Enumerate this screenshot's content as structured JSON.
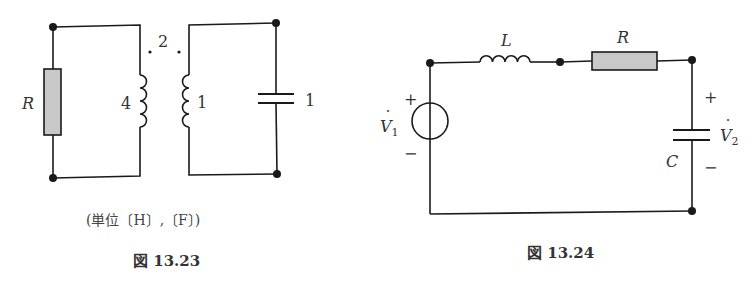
{
  "figures": [
    {
      "id": "fig-13-23",
      "caption": "図 13.23",
      "units_note": "(単位〔H〕,〔F〕)",
      "description": "Coupled-inductor circuit: resistor R on primary side with self-inductance 4, mutual inductance 2 (dot convention), secondary self-inductance 1 with capacitor 1",
      "labels": {
        "resistor": "R",
        "primary_inductance": "4",
        "mutual_inductance": "2",
        "secondary_inductance": "1",
        "capacitance": "1"
      },
      "units": [
        "H",
        "F"
      ]
    },
    {
      "id": "fig-13-24",
      "caption": "図 13.24",
      "description": "Series RLC circuit driven by voltage source V1; output V2 taken across capacitor C",
      "labels": {
        "inductor": "L",
        "resistor": "R",
        "capacitor": "C",
        "source_voltage": "V",
        "source_voltage_sub": "1",
        "output_voltage": "V",
        "output_voltage_sub": "2",
        "plus": "+",
        "minus": "−"
      }
    }
  ],
  "colors": {
    "wire": "#1a1a1a",
    "resistor_fill": "#c8c8c8",
    "background": "#ffffff"
  }
}
